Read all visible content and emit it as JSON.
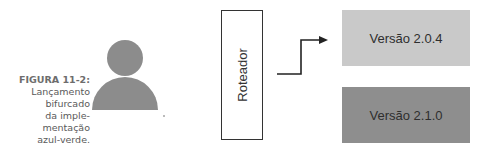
{
  "caption": {
    "label": "FIGURA 11-2:",
    "lines": [
      "Lançamento",
      "bifurcado",
      "da imple-",
      "mentação",
      "azul-verde."
    ]
  },
  "diagram": {
    "user_icon": "user-icon",
    "router": {
      "label": "Roteador"
    },
    "arrow": "arrow-right-icon",
    "versions": [
      {
        "label": "Versão 2.0.4",
        "color": "#c9c9c9"
      },
      {
        "label": "Versão 2.1.0",
        "color": "#8e8e8e"
      }
    ]
  },
  "colors": {
    "icon": "#8c8c8c",
    "border": "#333333"
  }
}
